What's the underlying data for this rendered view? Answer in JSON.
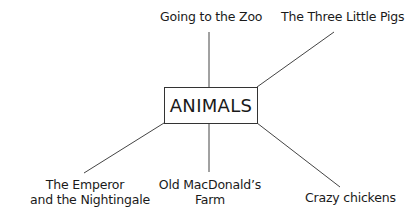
{
  "diagram": {
    "type": "mind-map",
    "center": {
      "label": "ANIMALS"
    },
    "branches": [
      {
        "label": "Going to the Zoo",
        "lines": [
          "Going to the Zoo"
        ]
      },
      {
        "label": "The Three Little Pigs",
        "lines": [
          "The Three Little Pigs"
        ]
      },
      {
        "label": "The Emperor and the Nightingale",
        "lines": [
          "The Emperor",
          "and the Nightingale"
        ]
      },
      {
        "label": "Old MacDonald's Farm",
        "lines": [
          "Old MacDonald’s",
          "Farm"
        ]
      },
      {
        "label": "Crazy chickens",
        "lines": [
          "Crazy chickens"
        ]
      }
    ],
    "colors": {
      "line": "#444444",
      "text": "#1a1a1a",
      "background": "#ffffff"
    }
  }
}
